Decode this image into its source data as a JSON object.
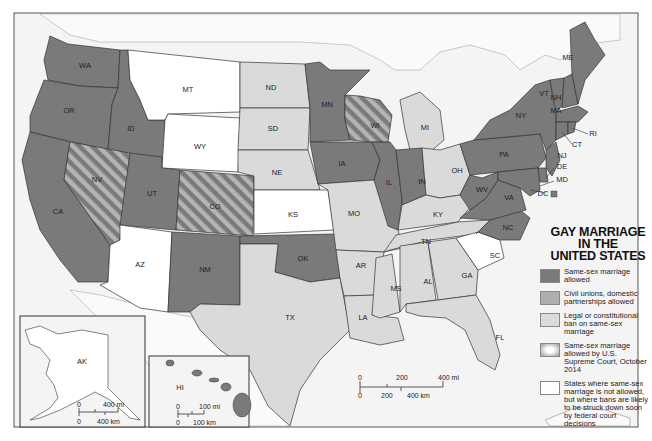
{
  "title": {
    "line1": "GAY MARRIAGE",
    "line2": "IN THE",
    "line3": "UNITED STATES"
  },
  "colors": {
    "allowed": "#7a7a7a",
    "civil_unions": "#aeaeae",
    "ban": "#dadada",
    "court_allowed_hatch_dark": "#7a7a7a",
    "court_allowed_hatch_light": "#b4b4b4",
    "struck_down_soon": "#ffffff",
    "water": "#f4f4f4",
    "border": "#333333"
  },
  "legend": [
    {
      "key": "allowed",
      "label": "Same-sex marriage allowed"
    },
    {
      "key": "civil_unions",
      "label": "Civil unions, domestic partnerships allowed"
    },
    {
      "key": "ban",
      "label": "Legal or constitutional ban on same-sex marriage"
    },
    {
      "key": "court_allowed",
      "label": "Same-sex marriage allowed by U.S. Supreme Court, October 2014"
    },
    {
      "key": "struck_down_soon",
      "label": "States where same-sex marriage is not allowed, but where bans are likely to be struck down soon by federal court decisions"
    }
  ],
  "states": {
    "WA": "allowed",
    "OR": "allowed",
    "CA": "allowed",
    "ID": "allowed",
    "UT": "allowed",
    "NM": "allowed",
    "OK": "allowed",
    "MN": "allowed",
    "IA": "allowed",
    "IL": "allowed",
    "IN": "allowed",
    "WV": "allowed",
    "VA": "allowed",
    "NC": "allowed",
    "PA": "allowed",
    "NY": "allowed",
    "VT": "allowed",
    "NH": "allowed",
    "ME": "allowed",
    "MA": "allowed",
    "RI": "allowed",
    "CT": "allowed",
    "NJ": "allowed",
    "DE": "allowed",
    "MD": "allowed",
    "DC": "allowed",
    "HI": "allowed",
    "NV": "court_allowed",
    "CO": "court_allowed",
    "WI": "court_allowed",
    "MT": "struck_down_soon",
    "WY": "struck_down_soon",
    "AZ": "struck_down_soon",
    "KS": "struck_down_soon",
    "SC": "struck_down_soon",
    "AK": "struck_down_soon",
    "ND": "ban",
    "SD": "ban",
    "NE": "ban",
    "TX": "ban",
    "MO": "ban",
    "AR": "ban",
    "LA": "ban",
    "MS": "ban",
    "AL": "ban",
    "GA": "ban",
    "FL": "ban",
    "TN": "ban",
    "KY": "ban",
    "OH": "ban",
    "MI": "ban"
  },
  "state_labels": [
    "WA",
    "OR",
    "CA",
    "ID",
    "NV",
    "MT",
    "WY",
    "UT",
    "CO",
    "AZ",
    "NM",
    "ND",
    "SD",
    "NE",
    "KS",
    "OK",
    "TX",
    "MN",
    "IA",
    "MO",
    "AR",
    "LA",
    "WI",
    "IL",
    "MI",
    "IN",
    "OH",
    "KY",
    "TN",
    "MS",
    "AL",
    "GA",
    "FL",
    "SC",
    "NC",
    "VA",
    "WV",
    "PA",
    "NY",
    "VT",
    "NH",
    "ME",
    "MA",
    "RI",
    "CT",
    "NJ",
    "DE",
    "MD",
    "DC",
    "AK",
    "HI"
  ],
  "scale_main": {
    "mi_ticks": [
      "0",
      "200",
      "400 mi"
    ],
    "km_ticks": [
      "0",
      "200",
      "400 km"
    ]
  },
  "scale_alaska": {
    "mi_ticks": [
      "0",
      "400 mi"
    ],
    "km_ticks": [
      "0",
      "400 km"
    ]
  },
  "scale_hawaii": {
    "mi_ticks": [
      "0",
      "100 mi"
    ],
    "km_ticks": [
      "0",
      "100 km"
    ]
  }
}
